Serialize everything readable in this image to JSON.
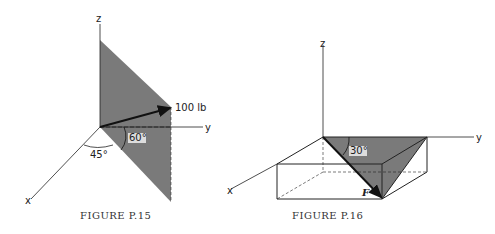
{
  "figure1": {
    "caption": "FIGURE P.15",
    "axes": {
      "x": "x",
      "y": "y",
      "z": "z"
    },
    "force_label": "100 lb",
    "angle_plane": "60°",
    "angle_base": "45°"
  },
  "figure2": {
    "caption": "FIGURE P.16",
    "axes": {
      "x": "x",
      "y": "y",
      "z": "z"
    },
    "force_label": "F",
    "angle": "30°"
  },
  "colors": {
    "shade": "#7a7a7a",
    "line": "#222222"
  }
}
